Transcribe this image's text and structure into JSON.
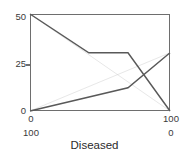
{
  "chart_data": {
    "type": "line",
    "title": "",
    "xlabel": "Diseased",
    "ylabel": "",
    "ylim": [
      0,
      50
    ],
    "xlim": [
      0,
      100
    ],
    "grid": false,
    "legend": null,
    "y_ticks": [
      "50",
      "25",
      "0"
    ],
    "y_tick_values": [
      50,
      25,
      0
    ],
    "x_axis_primary": {
      "ticks": [
        "0",
        "100"
      ],
      "values": [
        0,
        100
      ],
      "direction": "left-to-right"
    },
    "x_axis_secondary": {
      "ticks": [
        "100",
        "0"
      ],
      "values": [
        100,
        0
      ],
      "direction": "reversed"
    },
    "series": [
      {
        "name": "descending",
        "style": "thick",
        "color": "#595959",
        "points": [
          {
            "x": 0,
            "y": 50
          },
          {
            "x": 42,
            "y": 30
          },
          {
            "x": 70,
            "y": 30
          },
          {
            "x": 100,
            "y": 0
          }
        ]
      },
      {
        "name": "ascending",
        "style": "thick",
        "color": "#595959",
        "points": [
          {
            "x": 0,
            "y": 0
          },
          {
            "x": 70,
            "y": 12
          },
          {
            "x": 100,
            "y": 30
          }
        ]
      },
      {
        "name": "reference-descending",
        "style": "thin",
        "color": "#c9c9c9",
        "points": [
          {
            "x": 0,
            "y": 50
          },
          {
            "x": 100,
            "y": 0
          }
        ]
      },
      {
        "name": "reference-ascending",
        "style": "thin",
        "color": "#c9c9c9",
        "points": [
          {
            "x": 0,
            "y": 0
          },
          {
            "x": 100,
            "y": 30
          }
        ]
      }
    ]
  },
  "axis": {
    "y_50": "50",
    "y_25": "25",
    "y_0": "0",
    "x_left_primary": "0",
    "x_right_primary": "100",
    "x_left_secondary": "100",
    "x_right_secondary": "0",
    "title": "Diseased"
  },
  "colors": {
    "frame": "#6e6e6e",
    "series_thick": "#595959",
    "series_thin": "#c9c9c9",
    "text": "#2b2b2b"
  }
}
